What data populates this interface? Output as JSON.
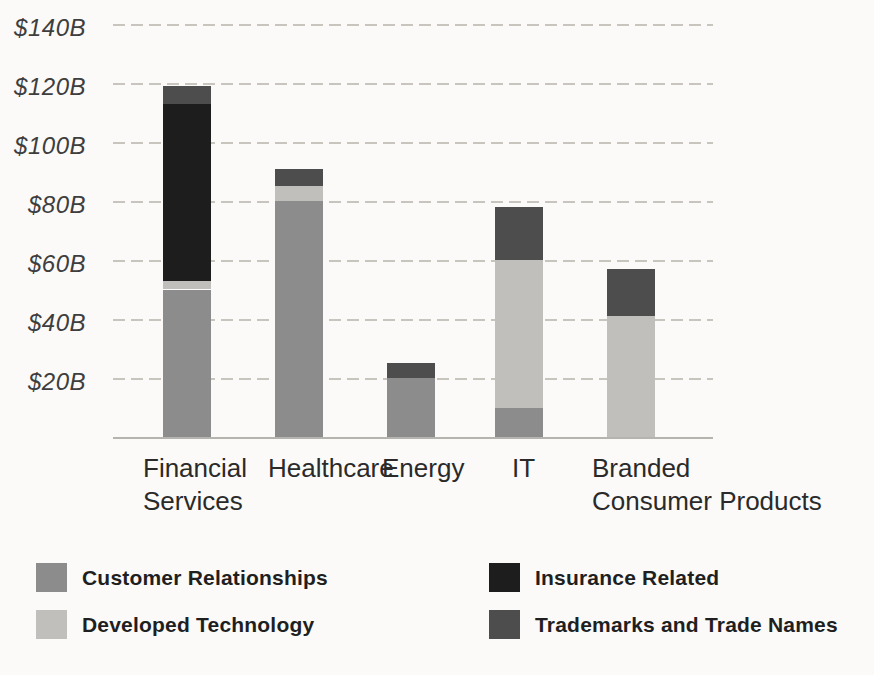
{
  "page": {
    "background_color": "#fbfaf8",
    "grid_color": "#c8c5bf",
    "baseline_color": "#b6b4af"
  },
  "chart_data": {
    "type": "bar",
    "stacked": true,
    "title": "",
    "xlabel": "",
    "ylabel": "",
    "value_unit": "$B",
    "categories": [
      "Financial Services",
      "Healthcare",
      "Energy",
      "IT",
      "Branded Consumer Products"
    ],
    "category_label_lines": [
      [
        "Financial",
        "Services"
      ],
      [
        "Healthcare"
      ],
      [
        "Energy"
      ],
      [
        "IT"
      ],
      [
        "Branded",
        "Consumer Products"
      ]
    ],
    "series": [
      {
        "name": "Customer Relationships",
        "color": "#8c8c8c",
        "values": [
          50,
          80,
          20,
          10,
          0
        ]
      },
      {
        "name": "Developed Technology",
        "color": "#c0bfbb",
        "values": [
          3,
          5,
          0,
          50,
          41
        ]
      },
      {
        "name": "Insurance Related",
        "color": "#1e1d1e",
        "values": [
          60,
          0,
          0,
          0,
          0
        ]
      },
      {
        "name": "Trademarks and Trade Names",
        "color": "#4e4d4e",
        "values": [
          6,
          6,
          5,
          18,
          16
        ]
      }
    ],
    "totals": [
      119,
      91,
      25,
      78,
      57
    ],
    "ylim": [
      0,
      148
    ],
    "yticks": [
      {
        "value": 140,
        "label": "$140B"
      },
      {
        "value": 120,
        "label": "$120B"
      },
      {
        "value": 100,
        "label": "$100B"
      },
      {
        "value": 80,
        "label": "$80B"
      },
      {
        "value": 60,
        "label": "$60B"
      },
      {
        "value": 40,
        "label": "$40B"
      },
      {
        "value": 20,
        "label": "$20B"
      }
    ],
    "grid": "horizontal dashed",
    "legend_position": "bottom, two columns",
    "legend": [
      {
        "label": "Customer Relationships",
        "color": "#8c8c8c",
        "column": "left",
        "row": 1
      },
      {
        "label": "Developed Technology",
        "color": "#c0bfbb",
        "column": "left",
        "row": 2
      },
      {
        "label": "Insurance Related",
        "color": "#1e1d1e",
        "column": "right",
        "row": 1
      },
      {
        "label": "Trademarks and Trade Names",
        "color": "#4e4d4e",
        "column": "right",
        "row": 2
      }
    ]
  }
}
